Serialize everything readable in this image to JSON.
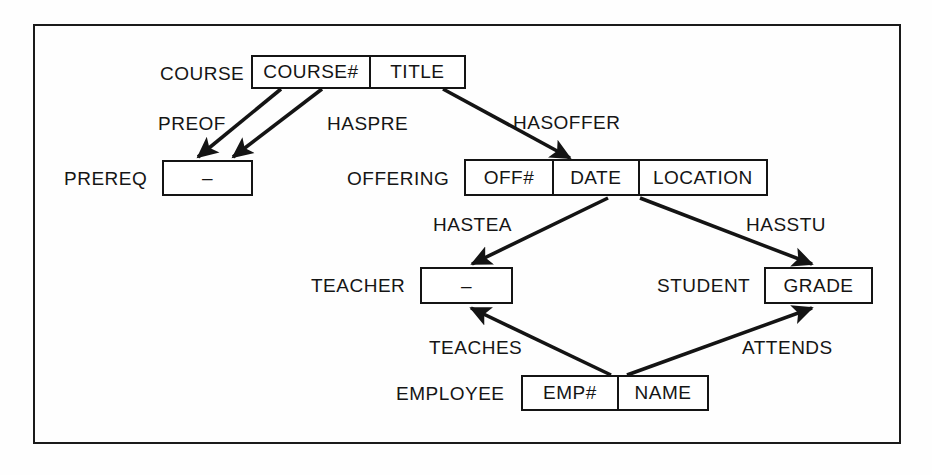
{
  "diagram": {
    "style": {
      "line_color": "#141414",
      "background": "#fefefe",
      "border_color": "#1a1a1a"
    },
    "entities": [
      {
        "id": "course",
        "label": "COURSE",
        "cells": [
          {
            "text": "COURSE#"
          },
          {
            "text": "TITLE"
          }
        ]
      },
      {
        "id": "prereq",
        "label": "PREREQ",
        "cells": [
          {
            "text": "–"
          }
        ]
      },
      {
        "id": "offering",
        "label": "OFFERING",
        "cells": [
          {
            "text": "OFF#"
          },
          {
            "text": "DATE"
          },
          {
            "text": "LOCATION"
          }
        ]
      },
      {
        "id": "teacher",
        "label": "TEACHER",
        "cells": [
          {
            "text": "–"
          }
        ]
      },
      {
        "id": "student",
        "label": "STUDENT",
        "cells": [
          {
            "text": "GRADE"
          }
        ]
      },
      {
        "id": "employee",
        "label": "EMPLOYEE",
        "cells": [
          {
            "text": "EMP#"
          },
          {
            "text": "NAME"
          }
        ]
      }
    ],
    "relationships": [
      {
        "id": "preof",
        "label": "PREOF",
        "from": "course",
        "to": "prereq"
      },
      {
        "id": "haspre",
        "label": "HASPRE",
        "from": "course",
        "to": "prereq"
      },
      {
        "id": "hasoffer",
        "label": "HASOFFER",
        "from": "course",
        "to": "offering"
      },
      {
        "id": "hastea",
        "label": "HASTEA",
        "from": "offering",
        "to": "teacher"
      },
      {
        "id": "hasstu",
        "label": "HASSTU",
        "from": "offering",
        "to": "student"
      },
      {
        "id": "teaches",
        "label": "TEACHES",
        "from": "employee",
        "to": "teacher"
      },
      {
        "id": "attends",
        "label": "ATTENDS",
        "from": "employee",
        "to": "student"
      }
    ]
  }
}
